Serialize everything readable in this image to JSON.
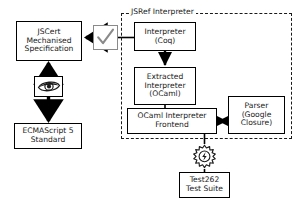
{
  "diagram": {
    "group": {
      "name": "jsref-interpreter-group",
      "label": "JSRef Interpreter",
      "style": "dashed",
      "color": "#1a1a1a"
    },
    "nodes": [
      {
        "id": "jscert",
        "label": "JSCert\nMechanised\nSpecification",
        "shape": "rect",
        "border": "#000000"
      },
      {
        "id": "ecmascript",
        "label": "ECMAScript 5\nStandard",
        "shape": "rect",
        "border": "#000000"
      },
      {
        "id": "coq",
        "label": "Interpreter\n(Coq)",
        "shape": "rect",
        "border": "#000000"
      },
      {
        "id": "extracted",
        "label": "Extracted\nInterpreter\n(OCaml)",
        "shape": "rect",
        "border": "#000000"
      },
      {
        "id": "frontend",
        "label": "OCaml Interpreter\nFrontend",
        "shape": "rect",
        "border": "#000000"
      },
      {
        "id": "parser",
        "label": "Parser\n(Google\nClosure)",
        "shape": "rect",
        "border": "#000000"
      },
      {
        "id": "test262",
        "label": "Test262\nTest Suite",
        "shape": "rect",
        "border": "#000000"
      }
    ],
    "icons": [
      {
        "id": "check",
        "name": "checkmark-icon",
        "meaning": "proved correct",
        "border": "#8a8a8a",
        "stroke": "#8a8a8a"
      },
      {
        "id": "eye",
        "name": "eye-icon",
        "meaning": "manual inspection",
        "border": "#000000",
        "fill": "#1a1a1a"
      },
      {
        "id": "gear",
        "name": "gear-icon",
        "meaning": "test execution",
        "stroke": "#1a1a1a"
      }
    ],
    "edges": [
      {
        "from": "coq",
        "to": "jscert",
        "direction": "left",
        "via": "check"
      },
      {
        "from": "jscert",
        "to": "eye",
        "direction": "up"
      },
      {
        "from": "eye",
        "to": "ecmascript",
        "direction": "down"
      },
      {
        "from": "coq",
        "to": "extracted",
        "direction": "down"
      },
      {
        "from": "extracted",
        "to": "frontend",
        "direction": "down"
      },
      {
        "from": "parser",
        "to": "frontend",
        "direction": "both"
      },
      {
        "from": "frontend",
        "to": "test262",
        "direction": "down",
        "via": "gear"
      }
    ]
  }
}
